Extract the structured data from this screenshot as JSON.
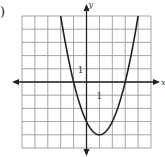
{
  "label": ")",
  "chart_data": {
    "type": "line",
    "title": "",
    "xlabel": "x",
    "ylabel": "y",
    "xlim": [
      -5,
      5
    ],
    "ylim": [
      -5,
      5
    ],
    "grid": true,
    "tick_labels": {
      "x": "1",
      "y": "1"
    },
    "function": "y = x^2 - 2x - 3",
    "vertex": [
      1,
      -4
    ],
    "x_intercepts": [
      -1,
      3
    ],
    "y_intercept": -3,
    "series": [
      {
        "name": "parabola",
        "x": [
          -2,
          -1,
          0,
          1,
          2,
          3,
          4
        ],
        "y": [
          5,
          0,
          -3,
          -4,
          -3,
          0,
          5
        ]
      }
    ]
  },
  "colors": {
    "grid": "#9a9a9a",
    "axis": "#222222",
    "curve": "#222222"
  }
}
